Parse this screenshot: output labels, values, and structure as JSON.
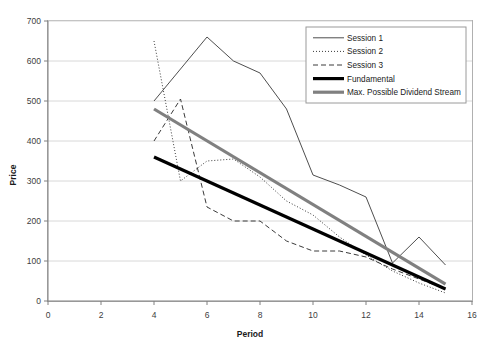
{
  "chart_data": {
    "type": "line",
    "title": "",
    "xlabel": "Period",
    "ylabel": "Price",
    "xlim": [
      0,
      16
    ],
    "ylim": [
      0,
      700
    ],
    "xticks": [
      0,
      2,
      4,
      6,
      8,
      10,
      12,
      14,
      16
    ],
    "yticks": [
      0,
      100,
      200,
      300,
      400,
      500,
      600,
      700
    ],
    "grid": "horizontal",
    "legend_position": "top-right",
    "x": [
      4,
      5,
      6,
      7,
      8,
      9,
      10,
      11,
      12,
      13,
      14,
      15
    ],
    "series": [
      {
        "name": "Session 1",
        "style": "solid-thin",
        "color": "#3a3a3a",
        "x": [
          4,
          5,
          6,
          7,
          8,
          9,
          10,
          11,
          12,
          13,
          14,
          15
        ],
        "values": [
          500,
          580,
          660,
          600,
          570,
          480,
          315,
          290,
          260,
          95,
          160,
          90
        ]
      },
      {
        "name": "Session 2",
        "style": "dotted",
        "color": "#3a3a3a",
        "x": [
          4,
          5,
          6,
          7,
          8,
          9,
          10,
          11,
          12,
          13,
          14,
          15
        ],
        "values": [
          650,
          300,
          350,
          355,
          310,
          250,
          215,
          160,
          115,
          75,
          45,
          20
        ]
      },
      {
        "name": "Session 3",
        "style": "dashed",
        "color": "#3a3a3a",
        "x": [
          4,
          5,
          6,
          7,
          8,
          9,
          10,
          11,
          12,
          13,
          14,
          15
        ],
        "values": [
          400,
          505,
          235,
          200,
          200,
          150,
          125,
          125,
          110,
          80,
          55,
          30
        ]
      },
      {
        "name": "Fundamental",
        "style": "solid-thick",
        "color": "#000000",
        "x": [
          4,
          15
        ],
        "values": [
          360,
          30
        ]
      },
      {
        "name": "Max. Possible Dividend Stream",
        "style": "solid-thick-gray",
        "color": "#808080",
        "x": [
          4,
          15
        ],
        "values": [
          480,
          42
        ]
      }
    ],
    "legend": [
      {
        "label": "Session 1",
        "style": "solid-thin",
        "color": "#3a3a3a"
      },
      {
        "label": "Session 2",
        "style": "dotted",
        "color": "#3a3a3a"
      },
      {
        "label": "Session 3",
        "style": "dashed",
        "color": "#3a3a3a"
      },
      {
        "label": "Fundamental",
        "style": "solid-thick",
        "color": "#000000"
      },
      {
        "label": "Max. Possible Dividend Stream",
        "style": "solid-thick-gray",
        "color": "#808080"
      }
    ],
    "colors": {
      "axis": "#808080",
      "grid": "#d8d8d8",
      "plot_border": "#b0b0b0",
      "background": "#ffffff",
      "fundamental": "#000000",
      "max_dividend": "#808080",
      "session": "#3a3a3a"
    }
  }
}
